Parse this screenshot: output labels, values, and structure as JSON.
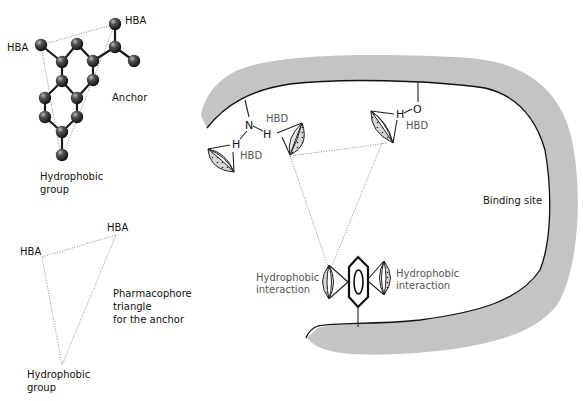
{
  "figure": {
    "type": "pharmacophore-binding-diagram",
    "colors": {
      "binding_site_band": "#c4c4c4",
      "rim_line": "#111111",
      "atom_fill": "#3a3a3a",
      "dotted_line": "#8a8a8a",
      "grey_label": "#555555",
      "black_label": "#111111"
    }
  },
  "molecule": {
    "labels": {
      "hba_left": "HBA",
      "hba_top": "HBA",
      "anchor": "Anchor",
      "hydrophobic_line1": "Hydrophobic",
      "hydrophobic_line2": "group"
    }
  },
  "triangle": {
    "labels": {
      "hba_left": "HBA",
      "hba_right": "HBA",
      "hydrophobic_line1": "Hydrophobic",
      "hydrophobic_line2": "group",
      "caption_line1": "Pharmacophore",
      "caption_line2": "triangle",
      "caption_line3": "for the anchor"
    }
  },
  "binding_site": {
    "label": "Binding site",
    "amine": {
      "n": "N",
      "h1": "H",
      "h2": "H",
      "hbd1": "HBD",
      "hbd2": "HBD"
    },
    "hydroxyl": {
      "o": "O",
      "h": "H",
      "hbd": "HBD"
    },
    "hydrophobic_left_line1": "Hydrophobic",
    "hydrophobic_left_line2": "interaction",
    "hydrophobic_right_line1": "Hydrophobic",
    "hydrophobic_right_line2": "interaction"
  }
}
